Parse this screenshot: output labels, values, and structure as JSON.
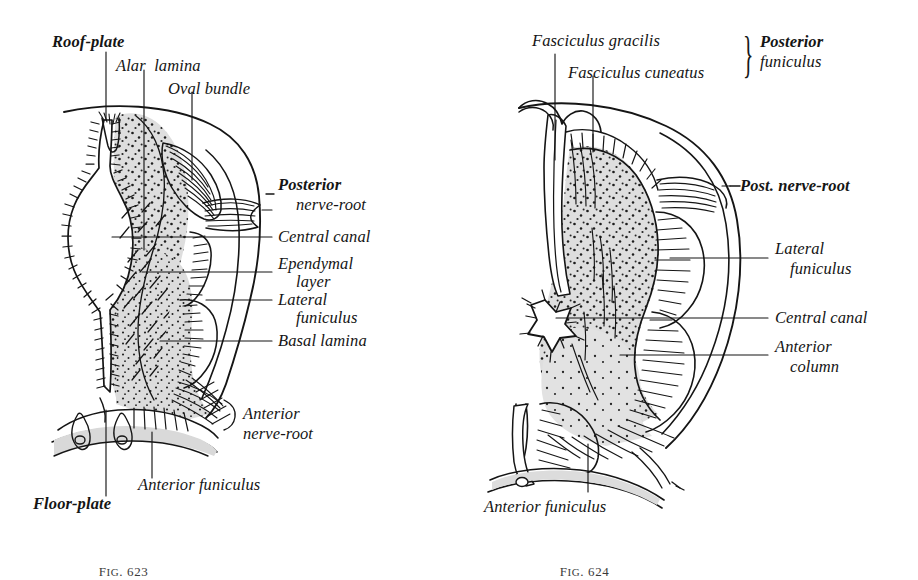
{
  "plate": {
    "background_color": "#ffffff",
    "ink_color": "#151515",
    "gray_fill": "#dcdcdc",
    "width": 918,
    "height": 569
  },
  "figures": [
    {
      "id": "fig-623",
      "caption": "Fig. 623",
      "caption_prefix": "F",
      "caption_small_caps": "IG",
      "caption_number": ". 623",
      "subject": "Transverse section of embryonic spinal cord",
      "labels": [
        {
          "key": "roof_plate",
          "text": "Roof-plate",
          "style": "bold",
          "align": "left"
        },
        {
          "key": "alar_lamina",
          "text": "Alar  lamina",
          "style": "normal",
          "align": "left"
        },
        {
          "key": "oval_bundle",
          "text": "Oval bundle",
          "style": "normal",
          "align": "left"
        },
        {
          "key": "posterior_nerve_root_1",
          "text": "Posterior",
          "style": "bold",
          "align": "left"
        },
        {
          "key": "posterior_nerve_root_2",
          "text": "nerve-root",
          "style": "normal",
          "align": "left"
        },
        {
          "key": "central_canal",
          "text": "Central canal",
          "style": "normal",
          "align": "left"
        },
        {
          "key": "ependymal_1",
          "text": "Ependymal",
          "style": "normal",
          "align": "left"
        },
        {
          "key": "ependymal_2",
          "text": "layer",
          "style": "normal",
          "align": "left"
        },
        {
          "key": "lateral_funiculus_1",
          "text": "Lateral",
          "style": "normal",
          "align": "left"
        },
        {
          "key": "lateral_funiculus_2",
          "text": "funiculus",
          "style": "normal",
          "align": "left"
        },
        {
          "key": "basal_lamina",
          "text": "Basal lamina",
          "style": "normal",
          "align": "left"
        },
        {
          "key": "anterior_nerve_root_1",
          "text": "Anterior",
          "style": "normal",
          "align": "left"
        },
        {
          "key": "anterior_nerve_root_2",
          "text": "nerve-root",
          "style": "normal",
          "align": "left"
        },
        {
          "key": "anterior_funiculus",
          "text": "Anterior funiculus",
          "style": "normal",
          "align": "left"
        },
        {
          "key": "floor_plate",
          "text": "Floor-plate",
          "style": "bold",
          "align": "left"
        }
      ]
    },
    {
      "id": "fig-624",
      "caption": "Fig. 624",
      "caption_prefix": "F",
      "caption_small_caps": "IG",
      "caption_number": ". 624",
      "subject": "Transverse section of more developed spinal cord",
      "labels": [
        {
          "key": "fasciculus_gracilis",
          "text": "Fasciculus gracilis",
          "style": "normal",
          "align": "left"
        },
        {
          "key": "fasciculus_cuneatus",
          "text": "Fasciculus cuneatus",
          "style": "normal",
          "align": "left"
        },
        {
          "key": "posterior_funiculus_1",
          "text": "Posterior",
          "style": "bold",
          "align": "left"
        },
        {
          "key": "posterior_funiculus_2",
          "text": "funiculus",
          "style": "normal",
          "align": "left"
        },
        {
          "key": "post_nerve_root",
          "text": "Post. nerve-root",
          "style": "bold",
          "align": "left"
        },
        {
          "key": "lateral_funiculus_1",
          "text": "Lateral",
          "style": "normal",
          "align": "left"
        },
        {
          "key": "lateral_funiculus_2",
          "text": "funiculus",
          "style": "normal",
          "align": "left"
        },
        {
          "key": "central_canal",
          "text": "Central canal",
          "style": "normal",
          "align": "left"
        },
        {
          "key": "anterior_column_1",
          "text": "Anterior",
          "style": "normal",
          "align": "left"
        },
        {
          "key": "anterior_column_2",
          "text": "column",
          "style": "normal",
          "align": "left"
        },
        {
          "key": "anterior_funiculus",
          "text": "Anterior funiculus",
          "style": "normal",
          "align": "left"
        }
      ],
      "brace_symbol": "}"
    }
  ]
}
